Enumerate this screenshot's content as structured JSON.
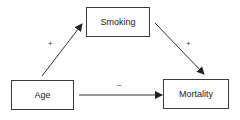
{
  "diagram": {
    "nodes": [
      {
        "id": "smoking",
        "label": "Smoking"
      },
      {
        "id": "age",
        "label": "Age"
      },
      {
        "id": "mortality",
        "label": "Mortality"
      }
    ],
    "edges": [
      {
        "from": "age",
        "to": "smoking",
        "sign": "+"
      },
      {
        "from": "smoking",
        "to": "mortality",
        "sign": "+"
      },
      {
        "from": "age",
        "to": "mortality",
        "sign": "–"
      }
    ],
    "colors": {
      "line": "#333333",
      "background": "#ffffff"
    }
  }
}
